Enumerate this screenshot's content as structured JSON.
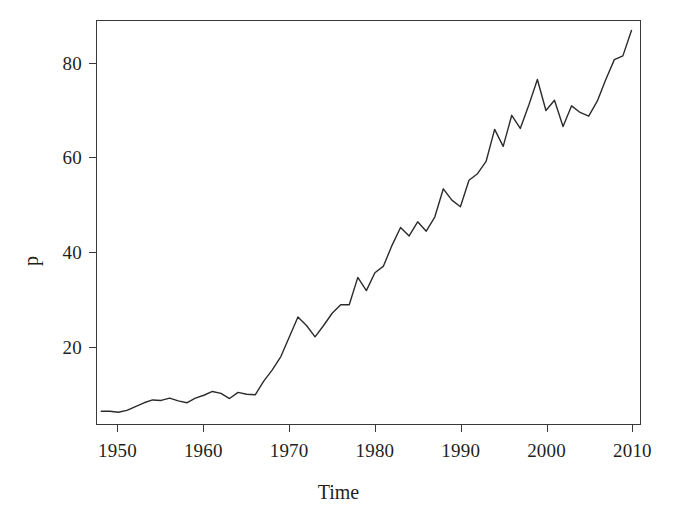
{
  "chart_data": {
    "type": "line",
    "title": "",
    "xlabel": "Time",
    "ylabel": "p",
    "xlim": [
      1947.5,
      2011.0
    ],
    "ylim": [
      3.5,
      89.0
    ],
    "grid": false,
    "legend": null,
    "xticks": [
      1950,
      1960,
      1970,
      1980,
      1990,
      2000,
      2010
    ],
    "yticks": [
      20,
      40,
      60,
      80
    ],
    "series": [
      {
        "name": "p",
        "color": "#2b2b2b",
        "x": [
          1948,
          1949,
          1950,
          1951,
          1952,
          1953,
          1954,
          1955,
          1956,
          1957,
          1958,
          1959,
          1960,
          1961,
          1962,
          1963,
          1964,
          1965,
          1966,
          1967,
          1968,
          1969,
          1970,
          1971,
          1972,
          1973,
          1974,
          1975,
          1976,
          1977,
          1978,
          1979,
          1980,
          1981,
          1982,
          1983,
          1984,
          1985,
          1986,
          1987,
          1988,
          1989,
          1990,
          1991,
          1992,
          1993,
          1994,
          1995,
          1996,
          1997,
          1998,
          1999,
          2000,
          2001,
          2002,
          2003,
          2004,
          2005,
          2006,
          2007,
          2008,
          2009,
          2010
        ],
        "y": [
          6.2,
          6.2,
          6.0,
          6.4,
          7.2,
          8.0,
          8.6,
          8.5,
          9.0,
          8.4,
          8.0,
          9.0,
          9.6,
          10.4,
          10.0,
          8.9,
          10.2,
          9.8,
          9.7,
          12.6,
          15.0,
          17.8,
          22.0,
          26.2,
          24.4,
          22.0,
          24.4,
          27.0,
          28.8,
          28.8,
          34.6,
          31.8,
          35.6,
          37.0,
          41.4,
          45.2,
          43.4,
          46.4,
          44.4,
          47.4,
          53.4,
          51.0,
          49.6,
          55.2,
          56.6,
          59.2,
          66.0,
          62.4,
          69.0,
          66.2,
          71.2,
          76.6,
          70.0,
          72.2,
          66.6,
          71.0,
          69.6,
          68.8,
          72.0,
          76.6,
          80.8,
          81.6,
          87.0
        ]
      }
    ]
  },
  "axes": {
    "y_tick_labels": [
      "80",
      "60",
      "40",
      "20"
    ],
    "x_tick_labels": [
      "1950",
      "1960",
      "1970",
      "1980",
      "1990",
      "2000",
      "2010"
    ],
    "y_axis_title": "p",
    "x_axis_title": "Time"
  },
  "colors": {
    "line": "#2b2b2b",
    "frame": "#3a3a3a",
    "text": "#1f1f1f",
    "background": "#ffffff"
  }
}
